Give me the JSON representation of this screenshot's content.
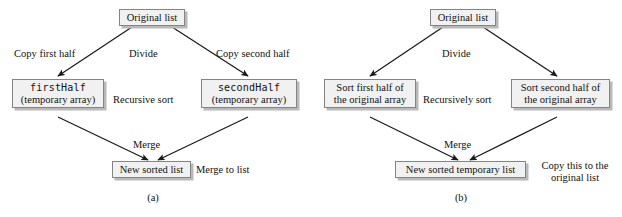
{
  "figure": {
    "panels": [
      {
        "id": "a",
        "caption": "(a)",
        "boxes": {
          "top": {
            "line1": "Original list",
            "line2": ""
          },
          "left": {
            "line1": "firstHalf",
            "line2": "(temporary array)",
            "mono_line1": true
          },
          "right": {
            "line1": "secondHalf",
            "line2": "(temporary array)",
            "mono_line1": true
          },
          "bottom": {
            "line1": "New sorted list",
            "line2": ""
          }
        },
        "labels": {
          "left_edge": "Copy first half",
          "center_top": "Divide",
          "right_edge": "Copy second half",
          "center_middle": "Recursive sort",
          "center_bottom": "Merge",
          "bottom_side": "Merge to list"
        }
      },
      {
        "id": "b",
        "caption": "(b)",
        "boxes": {
          "top": {
            "line1": "Original list",
            "line2": ""
          },
          "left": {
            "line1": "Sort first half of",
            "line2": "the original array",
            "mono_line1": false
          },
          "right": {
            "line1": "Sort second half of",
            "line2": "the original array",
            "mono_line1": false
          },
          "bottom": {
            "line1": "New sorted temporary list",
            "line2": ""
          }
        },
        "labels": {
          "left_edge": "",
          "center_top": "Divide",
          "right_edge": "",
          "center_middle": "Recursively sort",
          "center_bottom": "Merge",
          "bottom_side_line1": "Copy this to the",
          "bottom_side_line2": "original list"
        }
      }
    ]
  },
  "style": {
    "box_fill": "#f1f1f1",
    "box_border": "#848484",
    "box_shadow": "#b9b9b9",
    "arrow_color": "#1a1a1a",
    "text_color": "#111111",
    "background": "#ffffff"
  }
}
